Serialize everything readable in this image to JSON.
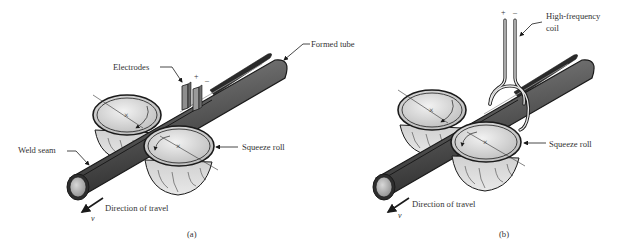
{
  "figure": {
    "panels": [
      {
        "id": "a",
        "caption": "(a)",
        "labels": {
          "electrodes": "Electrodes",
          "formed_tube": "Formed tube",
          "squeeze_roll": "Squeeze roll",
          "weld_seam": "Weld seam",
          "direction": "Direction of travel",
          "velocity": "v",
          "plus": "+",
          "minus": "–"
        }
      },
      {
        "id": "b",
        "caption": "(b)",
        "labels": {
          "coil": "High-frequency",
          "coil_line2": "coil",
          "squeeze_roll": "Squeeze roll",
          "direction": "Direction of travel",
          "velocity": "v",
          "plus": "+",
          "minus": "–"
        }
      }
    ],
    "colors": {
      "tube_dark": "#3a3a3a",
      "tube_mid": "#6b6b6b",
      "roll_light": "#e2e2e2",
      "roll_mid": "#bdbdbd",
      "outline": "#1a1a1a",
      "text": "#333333"
    }
  }
}
